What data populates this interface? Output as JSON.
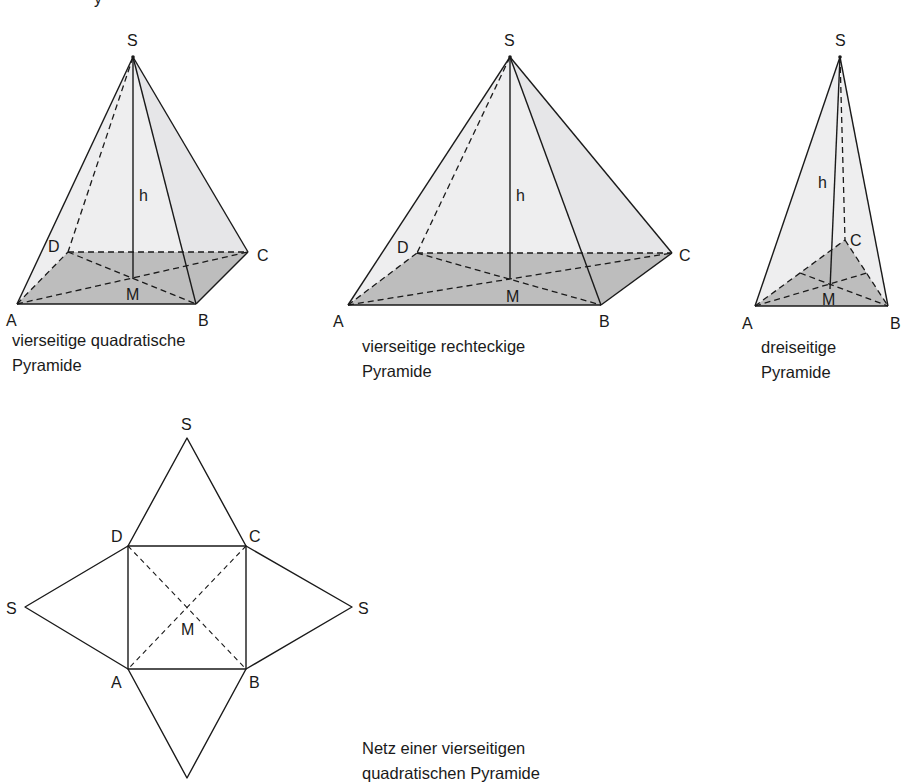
{
  "top_partial_glyph": "y",
  "pyramids": [
    {
      "id": "square",
      "caption_line1": "vierseitige quadratische",
      "caption_line2": "Pyramide",
      "labels": {
        "S": "S",
        "h": "h",
        "A": "A",
        "B": "B",
        "C": "C",
        "D": "D",
        "M": "M"
      }
    },
    {
      "id": "rectangular",
      "caption_line1": "vierseitige rechteckige",
      "caption_line2": "Pyramide",
      "labels": {
        "S": "S",
        "h": "h",
        "A": "A",
        "B": "B",
        "C": "C",
        "D": "D",
        "M": "M"
      }
    },
    {
      "id": "triangular",
      "caption_line1": "dreiseitige",
      "caption_line2": "Pyramide",
      "labels": {
        "S": "S",
        "h": "h",
        "A": "A",
        "B": "B",
        "C": "C",
        "M": "M"
      }
    }
  ],
  "net": {
    "caption_line1": "Netz einer vierseitigen",
    "caption_line2": "quadratischen Pyramide",
    "labels": {
      "S_top": "S",
      "S_left": "S",
      "S_right": "S",
      "A": "A",
      "B": "B",
      "C": "C",
      "D": "D",
      "M": "M"
    }
  },
  "colors": {
    "line": "#1a1a1a",
    "face": "#eeeeef",
    "base": "#bdbdbd",
    "background": "#ffffff"
  }
}
